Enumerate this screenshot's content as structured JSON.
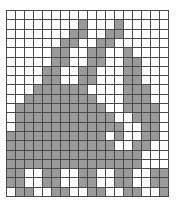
{
  "artwork": {
    "title": "rabbit-pixel-grid",
    "subject": "rabbit",
    "grid": {
      "columns": 18,
      "rows": 20,
      "cell_width_px": 9.06,
      "cell_height_px": 9.35,
      "origin_x_px": 6,
      "origin_y_px": 10,
      "width_px": 163,
      "height_px": 187
    },
    "colors": {
      "background": "#ffffff",
      "filled": "#9a9a9a",
      "gridline": "#4a4a4a",
      "canvas": "#ffffff"
    },
    "legend": {
      "filled_label": "filled",
      "empty_label": "empty"
    },
    "pattern": [
      "000000000000000000",
      "000000001000100000",
      "000000011001100000",
      "000000110011000000",
      "000001100110010000",
      "000001100110011000",
      "000011001100011000",
      "000011001100011000",
      "000111111000011100",
      "001111111100011100",
      "011111111110011110",
      "011111111111001110",
      "011111111111100110",
      "111111111110100110",
      "111111111111001100",
      "111111111111111000",
      "111111111111111000",
      "110011001100110011",
      "110011001100110011",
      "011001100110011001"
    ]
  }
}
